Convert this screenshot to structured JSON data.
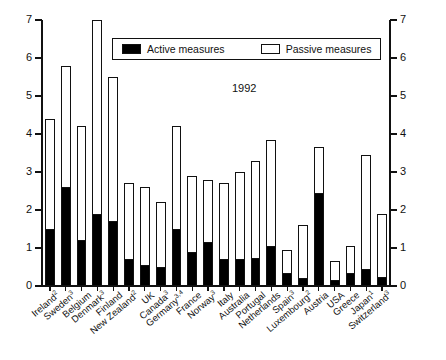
{
  "chart_data": {
    "type": "bar",
    "subtype": "stacked",
    "title": "",
    "annotation": "1992",
    "xlabel": "",
    "ylabel": "",
    "ylim": [
      0,
      7
    ],
    "yticks": [
      0,
      1,
      2,
      3,
      4,
      5,
      6,
      7
    ],
    "ytick_labels": [
      "0",
      "1",
      "2",
      "3",
      "4",
      "5",
      "6",
      "7"
    ],
    "right_axis": true,
    "right_ytick_labels": [
      "0",
      "1",
      "2",
      "3",
      "4",
      "5",
      "6",
      "7"
    ],
    "grid": false,
    "legend_position": "top-center",
    "categories": [
      "Ireland²",
      "Sweden³",
      "Belgium",
      "Denmark³",
      "Finland",
      "New Zealand²",
      "UK",
      "Canada³",
      "Germany³,⁴",
      "France",
      "Norway³",
      "Italy",
      "Australia",
      "Portugal",
      "Netherlands",
      "Spain³",
      "Luxembourg²",
      "Austria",
      "USA",
      "Greece",
      "Japan¹",
      "Switzerland³"
    ],
    "category_names": [
      "Ireland",
      "Sweden",
      "Belgium",
      "Denmark",
      "Finland",
      "New Zealand",
      "UK",
      "Canada",
      "Germany",
      "France",
      "Norway",
      "Italy",
      "Australia",
      "Portugal",
      "Netherlands",
      "Spain",
      "Luxembourg",
      "Austria",
      "USA",
      "Greece",
      "Japan",
      "Switzerland"
    ],
    "category_footnotes": [
      "2",
      "3",
      "",
      "3",
      "",
      "2",
      "",
      "3",
      "3,4",
      "",
      "3",
      "",
      "",
      "",
      "",
      "3",
      "2",
      "",
      "",
      "",
      "1",
      "3"
    ],
    "series": [
      {
        "name": "Active measures",
        "color": "#000000",
        "values": [
          1.5,
          2.6,
          1.2,
          1.9,
          1.7,
          0.7,
          0.55,
          0.5,
          1.5,
          0.9,
          1.15,
          0.7,
          0.7,
          0.75,
          1.05,
          0.35,
          0.2,
          2.45,
          0.15,
          0.35,
          0.45,
          0.25
        ]
      },
      {
        "name": "Passive measures",
        "color": "#ffffff",
        "values": [
          2.9,
          3.2,
          3.0,
          5.1,
          3.8,
          2.0,
          2.05,
          1.7,
          2.7,
          2.0,
          1.65,
          2.0,
          2.3,
          2.55,
          2.8,
          0.6,
          1.4,
          1.2,
          0.5,
          0.7,
          3.0,
          1.65
        ]
      }
    ],
    "totals": [
      4.4,
      5.8,
      4.2,
      7.0,
      5.5,
      2.7,
      2.6,
      2.2,
      4.2,
      2.9,
      2.8,
      2.7,
      3.0,
      3.3,
      3.85,
      0.95,
      1.6,
      3.65,
      0.65,
      1.05,
      3.45,
      1.9
    ]
  },
  "legend": {
    "items": [
      {
        "label": "Active measures",
        "swatch": "filled-black"
      },
      {
        "label": "Passive measures",
        "swatch": "open-white"
      }
    ]
  }
}
